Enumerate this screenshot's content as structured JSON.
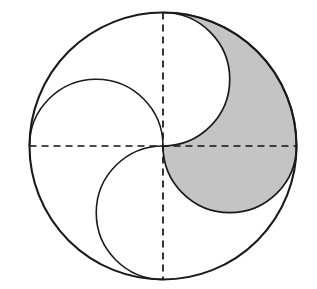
{
  "figure": {
    "canvas": {
      "width": 317,
      "height": 289,
      "background": "#ffffff"
    },
    "colors": {
      "stroke": "#1a1a1a",
      "shade_fill": "#c4c4c4",
      "shade_stroke": "#1a1a1a",
      "dash_stroke": "#111111",
      "white_fill": "#ffffff"
    },
    "stroke_widths": {
      "outer_circle": 2.1,
      "inner_arc": 1.6,
      "dashed_axis": 1.7
    },
    "dash_pattern": "7,5",
    "center": {
      "x": 163,
      "y": 146
    },
    "outer_circle": {
      "cx": 163,
      "cy": 146,
      "r": 133.5
    },
    "axes": {
      "horizontal": {
        "x1": 29.5,
        "y1": 146,
        "x2": 296.5,
        "y2": 146
      },
      "vertical": {
        "x1": 163,
        "y1": 12.5,
        "x2": 163,
        "y2": 279.5
      }
    },
    "semicircles": [
      {
        "name": "upper-left-arc",
        "cx": 96.25,
        "cy": 146,
        "r": 66.75,
        "half": "top"
      },
      {
        "name": "lower-left-arc",
        "cx": 163,
        "cy": 212.75,
        "r": 66.75,
        "half": "left"
      },
      {
        "name": "upper-right-arc",
        "cx": 163,
        "cy": 79.25,
        "r": 66.75,
        "half": "right"
      },
      {
        "name": "lower-right-arc",
        "cx": 229.75,
        "cy": 146,
        "r": 66.75,
        "half": "bottom"
      }
    ],
    "shaded_region": {
      "name": "shaded-lobe",
      "fill": "#c4c4c4",
      "path": "M 163 12.5 A 133.5 133.5 0 0 1 296.5 146 A 66.75 66.75 0 0 1 163 146 A 66.75 66.75 0 0 0 163 12.5 Z"
    },
    "labels": []
  }
}
